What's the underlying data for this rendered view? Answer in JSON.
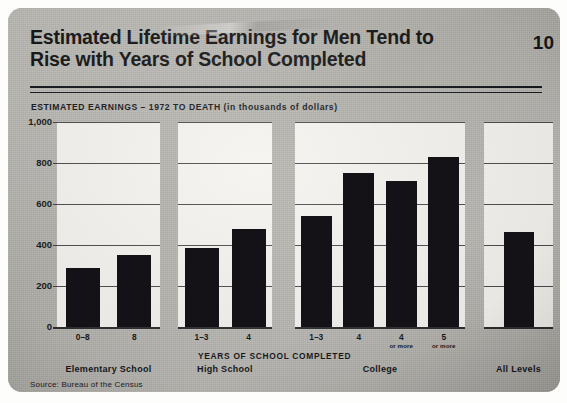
{
  "card": {
    "title_line_1": "Estimated Lifetime Earnings for Men Tend to",
    "title_line_2": "Rise with Years of School Completed",
    "page_number": "10",
    "subtitle": "ESTIMATED EARNINGS – 1972 TO DEATH (in thousands of dollars)",
    "source": "Source:  Bureau of the Census",
    "background_color": "#b9b7b2",
    "panel_color": "#f4f3ef",
    "bar_color": "#141216",
    "ink_color": "#16181b"
  },
  "chart_data": {
    "type": "bar",
    "title": "Estimated Lifetime Earnings for Men Tend to Rise with Years of School Completed",
    "subtitle": "ESTIMATED EARNINGS – 1972 TO DEATH (in thousands of dollars)",
    "xlabel": "YEARS OF SCHOOL COMPLETED",
    "ylabel": "",
    "ylim": [
      0,
      1000
    ],
    "yticks": [
      0,
      200,
      400,
      600,
      800,
      1000
    ],
    "ytick_labels": [
      "0",
      "200",
      "400",
      "600",
      "800",
      "1,000"
    ],
    "grid": true,
    "legend": false,
    "units": "thousands of dollars",
    "categories": [
      "0–8",
      "8",
      "1–3",
      "4",
      "1–3",
      "4 or more",
      "4 or more",
      "5 or more",
      ""
    ],
    "values": [
      288,
      350,
      385,
      478,
      540,
      750,
      710,
      830,
      465
    ],
    "groups": [
      {
        "name": "Elementary School",
        "bars": [
          {
            "label": "0–8",
            "sublabel": "",
            "value": 288
          },
          {
            "label": "8",
            "sublabel": "",
            "value": 350
          }
        ]
      },
      {
        "name": "High School",
        "bars": [
          {
            "label": "1–3",
            "sublabel": "",
            "value": 385
          },
          {
            "label": "4",
            "sublabel": "",
            "value": 478
          }
        ]
      },
      {
        "name": "College",
        "bars": [
          {
            "label": "1–3",
            "sublabel": "",
            "value": 540
          },
          {
            "label": "4",
            "sublabel": "",
            "value": 750
          },
          {
            "label": "4",
            "sublabel": "or more",
            "value": 710
          },
          {
            "label": "5",
            "sublabel": "or more",
            "value": 830
          }
        ]
      },
      {
        "name": "All Levels",
        "bars": [
          {
            "label": "",
            "sublabel": "",
            "value": 465
          }
        ]
      }
    ]
  }
}
